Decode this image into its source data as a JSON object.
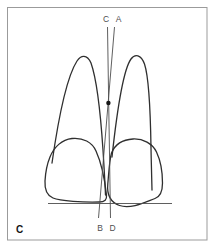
{
  "figure": {
    "panel_label": "C",
    "labels": {
      "top": [
        "C",
        "A"
      ],
      "bottom": [
        "B",
        "D"
      ]
    }
  },
  "icons": {
    "intersection_dot": "filled-circle"
  },
  "colors": {
    "background": "#ffffff",
    "border": "#9b9b9b",
    "tooth_outline": "#2f2f2f",
    "reference_line": "#4d4d4d",
    "label_text": "#4f4f4f",
    "panel_label": "#161616",
    "dot": "#161616"
  }
}
